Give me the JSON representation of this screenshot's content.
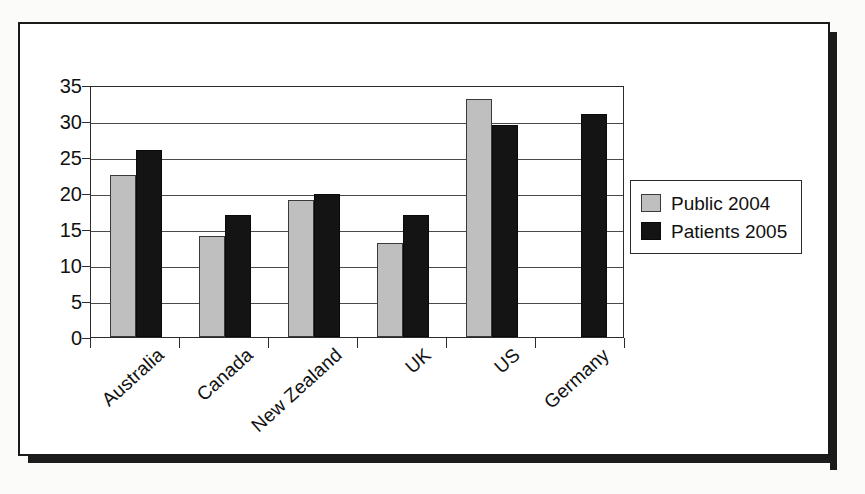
{
  "chart_data": {
    "type": "bar",
    "title": "",
    "subtitle": "",
    "xlabel": "",
    "ylabel": "",
    "ylim": [
      0,
      35
    ],
    "ytick_step": 5,
    "yticks": [
      0,
      5,
      10,
      15,
      20,
      25,
      30,
      35
    ],
    "ytick_labels": [
      "0",
      "5",
      "10",
      "15",
      "20",
      "25",
      "30",
      "35"
    ],
    "grid": true,
    "grid_axis": "y",
    "legend_position": "right",
    "categories": [
      "Australia",
      "Canada",
      "New Zealand",
      "UK",
      "US",
      "Germany"
    ],
    "series": [
      {
        "name": "Public 2004",
        "color": "#bfbfbf",
        "values": [
          22.5,
          14,
          19,
          13,
          33,
          null
        ]
      },
      {
        "name": "Patients 2005",
        "color": "#141414",
        "values": [
          26,
          17,
          19.8,
          17,
          29.5,
          31
        ]
      }
    ]
  },
  "legend": {
    "items": [
      {
        "label": "Public 2004",
        "swatch": "public"
      },
      {
        "label": "Patients 2005",
        "swatch": "patients"
      }
    ]
  },
  "axis": {
    "y_labels": [
      "35",
      "30",
      "25",
      "20",
      "15",
      "10",
      "5",
      "0"
    ]
  }
}
